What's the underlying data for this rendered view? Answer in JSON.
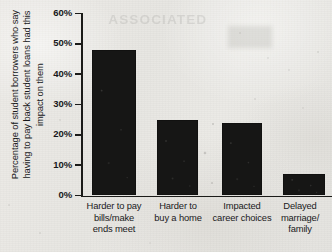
{
  "chart_data": {
    "type": "bar",
    "title": "",
    "subtitle": "",
    "xlabel": "",
    "ylabel": "Percentage of student borrowers who say\nhaving to pay back student loans had this\nimpact on them",
    "categories": [
      "Harder to pay\nbills/make\nends meet",
      "Harder to\nbuy a home",
      "Impacted\ncareer choices",
      "Delayed\nmarriage/\nfamily"
    ],
    "values": [
      48,
      25,
      24,
      7
    ],
    "value_labels": [
      "48%",
      "25%",
      "24%",
      "7%"
    ],
    "ylim": [
      0,
      60
    ],
    "ytick_values": [
      0,
      10,
      20,
      30,
      40,
      50,
      60
    ],
    "ytick_labels": [
      "0%",
      "10%",
      "20%",
      "30%",
      "40%",
      "50%",
      "60%"
    ],
    "grid": false,
    "legend": null,
    "legend_position": "none",
    "bar_color": "#161615",
    "axis_color": "#1b1b19",
    "background_color": "#e9e8e4"
  },
  "ghost": {
    "watermark_text": "ASSOCIATED"
  }
}
